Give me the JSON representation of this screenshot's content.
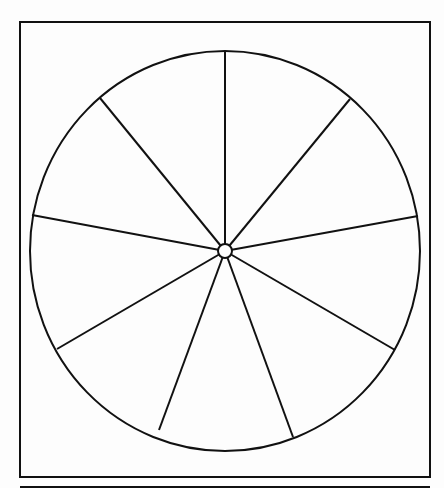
{
  "diagram": {
    "type": "wheel",
    "frame": {
      "x": 20,
      "y": 22,
      "width": 410,
      "height": 455
    },
    "bottom_rule": {
      "x1": 20,
      "x2": 430,
      "y": 487
    },
    "wheel": {
      "cx": 225,
      "cy": 251,
      "rx": 195,
      "ry": 200
    },
    "hub": {
      "cx": 225,
      "cy": 251,
      "r": 7
    },
    "segment_count": 9,
    "spokes": [
      {
        "x": 225,
        "y": 51
      },
      {
        "x": 350,
        "y": 99
      },
      {
        "x": 418,
        "y": 216
      },
      {
        "x": 395,
        "y": 350
      },
      {
        "x": 293,
        "y": 437
      },
      {
        "x": 159,
        "y": 430
      },
      {
        "x": 57,
        "y": 349
      },
      {
        "x": 32,
        "y": 215
      },
      {
        "x": 100,
        "y": 98
      }
    ],
    "segment_labels": [
      "",
      "",
      "",
      "",
      "",
      "",
      "",
      "",
      ""
    ],
    "colors": {
      "line": "#111111",
      "background": "#fdfdfd"
    }
  }
}
